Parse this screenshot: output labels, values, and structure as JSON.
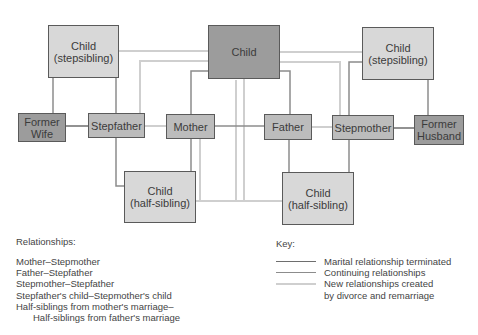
{
  "diagram": {
    "nodes": {
      "child_stepsibling_left": {
        "line1": "Child",
        "line2": "(stepsibling)"
      },
      "child_center": {
        "label": "Child"
      },
      "child_stepsibling_right": {
        "line1": "Child",
        "line2": "(stepsibling)"
      },
      "former_wife": {
        "line1": "Former",
        "line2": "Wife"
      },
      "stepfather": {
        "label": "Stepfather"
      },
      "mother": {
        "label": "Mother"
      },
      "father": {
        "label": "Father"
      },
      "stepmother": {
        "label": "Stepmother"
      },
      "former_husband": {
        "line1": "Former",
        "line2": "Husband"
      },
      "child_half_left": {
        "line1": "Child",
        "line2": "(half-sibling)"
      },
      "child_half_right": {
        "line1": "Child",
        "line2": "(half-sibling)"
      }
    },
    "colors": {
      "terminated": "#6e6e6e",
      "continuing": "#8c8c8c",
      "new": "#cfcfcf",
      "box_light": "#d8d8d8",
      "box_mid": "#bcbcbc",
      "box_dark": "#9c9c9c"
    }
  },
  "relationships": {
    "title": "Relationships:",
    "items": [
      "Mother–Stepmother",
      "Father–Stepfather",
      "Stepmother–Stepfather",
      "Stepfather's child–Stepmother's child",
      "Half-siblings from mother's marriage–"
    ],
    "continuation": "Half-siblings from father's marriage"
  },
  "key": {
    "title": "Key:",
    "items": [
      {
        "label": "Marital relationship terminated"
      },
      {
        "label": "Continuing relationships"
      },
      {
        "label": "New relationships created"
      }
    ],
    "continuation": "by divorce and remarriage"
  }
}
